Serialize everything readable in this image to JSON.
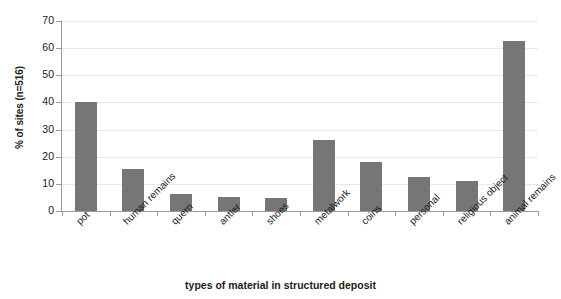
{
  "chart_data": {
    "type": "bar",
    "title": "",
    "xlabel": "types of material in structured deposit",
    "ylabel": "% of sites (n=516)",
    "categories": [
      "pot",
      "human remains",
      "quern",
      "antler",
      "shoes",
      "metalwork",
      "coins",
      "personal",
      "religious object",
      "animal remains"
    ],
    "values": [
      40,
      15.3,
      6.3,
      5.2,
      4.9,
      26,
      18,
      12.4,
      11.2,
      62.8
    ],
    "ylim": [
      0,
      70
    ],
    "ytick_labels": [
      "0",
      "10",
      "20",
      "30",
      "40",
      "50",
      "60",
      "70"
    ],
    "ytick_values": [
      0,
      10,
      20,
      30,
      40,
      50,
      60,
      70
    ],
    "grid": true,
    "legend": false,
    "bar_color": "#767676",
    "gridline_color": "#e8e8e8",
    "axis_color": "#9a9a9a"
  }
}
